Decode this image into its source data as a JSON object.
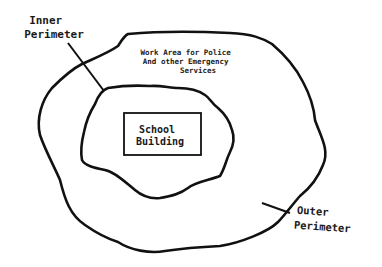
{
  "diagram": {
    "labels": {
      "inner_perimeter": [
        "Inner",
        "Perimeter"
      ],
      "work_area": [
        "Work Area for Police",
        "And other Emergency",
        "Services"
      ],
      "school_building": [
        "School",
        "Building"
      ],
      "outer_perimeter": [
        "Outer",
        "Perimeter"
      ]
    },
    "colors": {
      "stroke": "#111111",
      "background": "#ffffff"
    }
  }
}
